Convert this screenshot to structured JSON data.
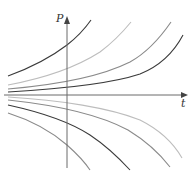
{
  "diagram": {
    "type": "solution-curves",
    "axes": {
      "y_label": "P",
      "x_label": "t",
      "origin": [
        67,
        95
      ],
      "y_axis": {
        "x": 67,
        "top": 17,
        "bottom": 168
      },
      "x_axis": {
        "y": 95,
        "left": 4,
        "right": 187
      }
    },
    "colors": {
      "axis": "#6a6a6a",
      "dark": "#3a3a3a",
      "mid": "#8a8a8a",
      "light": "#bdbdbd"
    },
    "curves": [
      {
        "name": "upper-1",
        "tone": "dark",
        "d": "M8,76 C30,68 50,58 67,45 C76,38 84,30 91,20"
      },
      {
        "name": "upper-2",
        "tone": "light",
        "d": "M8,85 C40,79 75,68 100,52 C112,43 122,33 131,22"
      },
      {
        "name": "upper-3",
        "tone": "mid",
        "d": "M8,89 C55,85 100,77 130,62 C148,52 160,38 171,22"
      },
      {
        "name": "upper-4",
        "tone": "dark",
        "d": "M8,92 C60,89 110,84 140,74 C160,66 174,52 183,35"
      },
      {
        "name": "lower-1",
        "tone": "light",
        "d": "M8,97 C60,100 110,108 140,120 C160,130 174,144 182,158"
      },
      {
        "name": "lower-2",
        "tone": "mid",
        "d": "M8,100 C55,105 100,115 128,130 C146,141 160,154 170,167"
      },
      {
        "name": "lower-3",
        "tone": "dark",
        "d": "M8,105 C40,112 70,122 90,135 C105,145 118,157 130,170"
      },
      {
        "name": "lower-4",
        "tone": "mid",
        "d": "M8,113 C30,120 52,132 67,145 C76,153 84,161 90,170"
      }
    ]
  }
}
